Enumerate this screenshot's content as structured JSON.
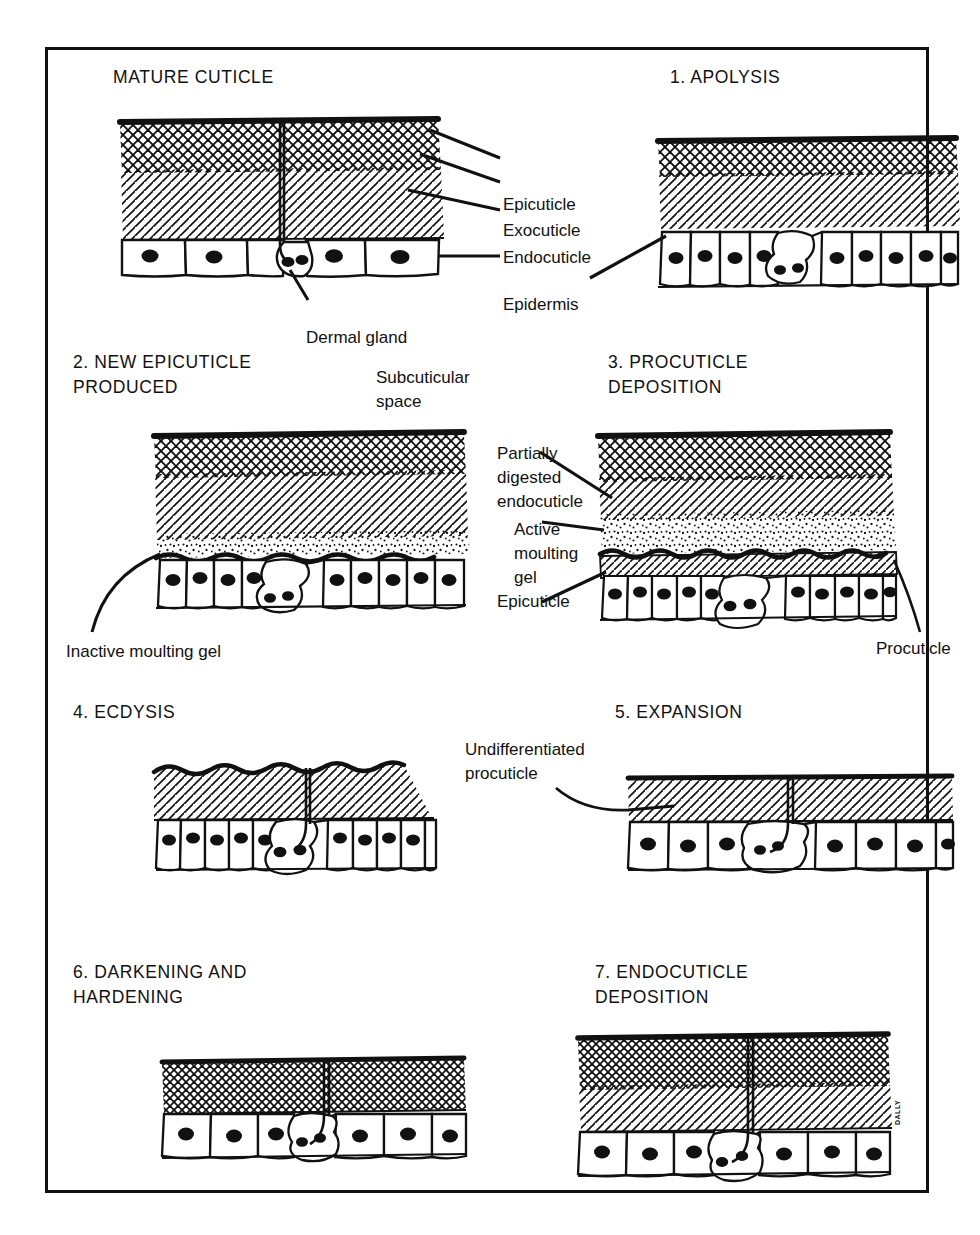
{
  "figure": {
    "artist_signature": "DALLY",
    "border_color": "#111111",
    "background_color": "#ffffff"
  },
  "panels": [
    {
      "id": "mature-cuticle",
      "title": "MATURE CUTICLE",
      "layers": [
        "epicuticle",
        "exocuticle",
        "endocuticle",
        "epidermis"
      ],
      "has_dermal_gland": true,
      "cell_count": 5
    },
    {
      "id": "apolysis",
      "title": "1. APOLYSIS",
      "layers": [
        "epicuticle",
        "exocuticle",
        "endocuticle",
        "epidermis"
      ],
      "has_dermal_gland": true,
      "cell_count": 10
    },
    {
      "id": "new-epicuticle-produced",
      "title": "2. NEW EPICUTICLE\nPRODUCED",
      "layers": [
        "epicuticle",
        "exocuticle",
        "endocuticle",
        "moulting-gel",
        "epidermis"
      ],
      "has_dermal_gland": true,
      "cell_count": 11
    },
    {
      "id": "procuticle-deposition",
      "title": "3. PROCUTICLE\nDEPOSITION",
      "layers": [
        "epicuticle",
        "exocuticle",
        "partially-digested-endocuticle",
        "active-moulting-gel",
        "new-epicuticle",
        "procuticle",
        "epidermis"
      ],
      "has_dermal_gland": true,
      "cell_count": 12
    },
    {
      "id": "ecdysis",
      "title": "4. ECDYSIS",
      "layers": [
        "procuticle",
        "epidermis"
      ],
      "has_dermal_gland": true,
      "cell_count": 10
    },
    {
      "id": "expansion",
      "title": "5. EXPANSION",
      "layers": [
        "undifferentiated-procuticle",
        "epidermis"
      ],
      "has_dermal_gland": true,
      "cell_count": 8
    },
    {
      "id": "darkening-and-hardening",
      "title": "6. DARKENING AND\nHARDENING",
      "layers": [
        "exocuticle",
        "epidermis"
      ],
      "has_dermal_gland": true,
      "cell_count": 6
    },
    {
      "id": "endocuticle-deposition",
      "title": "7. ENDOCUTICLE\nDEPOSITION",
      "layers": [
        "epicuticle",
        "exocuticle",
        "endocuticle",
        "epidermis"
      ],
      "has_dermal_gland": true,
      "cell_count": 6
    }
  ],
  "labels": {
    "epicuticle": "Epicuticle",
    "exocuticle": "Exocuticle",
    "endocuticle": "Endocuticle",
    "epidermis": "Epidermis",
    "dermal_gland": "Dermal gland",
    "subcuticular_space": "Subcuticular space",
    "inactive_moulting_gel": "Inactive moulting gel",
    "partially_digested_endocuticle": "Partially\ndigested\nendocuticle",
    "active_moulting_gel": "Active\nmoulting\ngel",
    "epicuticle_new": "Epicuticle",
    "procuticle": "Procuticle",
    "undifferentiated_procuticle": "Undifferentiated\nprocuticle"
  }
}
